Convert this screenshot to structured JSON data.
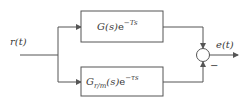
{
  "diagram": {
    "type": "block-diagram",
    "input": {
      "label": "r(t)"
    },
    "output": {
      "label": "e(t)"
    },
    "blocks": [
      {
        "id": "plant",
        "main": "G(s)",
        "exp_base": "e",
        "exp_power": "−Ts",
        "position": "top"
      },
      {
        "id": "model",
        "main": "G",
        "subscript": "r/m",
        "arg": "(s)",
        "exp_base": "e",
        "exp_power": "−τs",
        "position": "bottom"
      }
    ],
    "summing_junction": {
      "top_sign": "+",
      "bottom_sign": "−",
      "visible_sign_label": "−"
    },
    "colors": {
      "line": "#555555",
      "text": "#3a3a3a",
      "background": "#ffffff"
    }
  }
}
